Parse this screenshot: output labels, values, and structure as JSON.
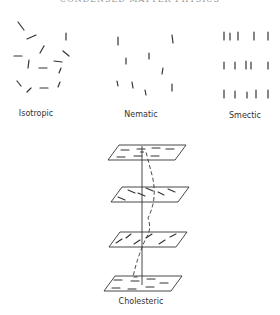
{
  "header": {
    "title": "CONDENSED MATTER PHYSICS"
  },
  "labels": {
    "isotropic": "Isotropic",
    "nematic": "Nematic",
    "smectic": "Smectic",
    "cholesteric": "Cholesteric"
  },
  "colors": {
    "ink": "#333333",
    "background": "#ffffff"
  },
  "phases": {
    "isotropic": {
      "molecules": [
        [
          18,
          22,
          24,
          30
        ],
        [
          27,
          39,
          36,
          35
        ],
        [
          66,
          33,
          66,
          40
        ],
        [
          14,
          56,
          22,
          56
        ],
        [
          40,
          53,
          44,
          46
        ],
        [
          63,
          51,
          69,
          56
        ],
        [
          54,
          61,
          62,
          62
        ],
        [
          29,
          60,
          28,
          68
        ],
        [
          39,
          68,
          47,
          68
        ],
        [
          61,
          68,
          59,
          73
        ],
        [
          17,
          81,
          21,
          86
        ],
        [
          60,
          82,
          58,
          87
        ],
        [
          27,
          92,
          31,
          88
        ],
        [
          40,
          88,
          48,
          88
        ]
      ]
    },
    "nematic": {
      "molecules": [
        [
          118,
          37,
          118,
          45
        ],
        [
          172,
          35,
          173,
          43
        ],
        [
          126,
          58,
          126,
          64
        ],
        [
          149,
          53,
          149,
          59
        ],
        [
          163,
          68,
          162,
          74
        ],
        [
          117,
          81,
          118,
          86
        ],
        [
          132,
          82,
          133,
          88
        ],
        [
          145,
          90,
          146,
          95
        ],
        [
          172,
          84,
          172,
          91
        ]
      ]
    },
    "smectic": {
      "rows": [
        [
          [
            224,
            32,
            224,
            40
          ],
          [
            230,
            33,
            230,
            40
          ],
          [
            238,
            32,
            238,
            40
          ],
          [
            254,
            32,
            254,
            40
          ],
          [
            268,
            32,
            268,
            40
          ]
        ],
        [
          [
            224,
            62,
            224,
            69
          ],
          [
            235,
            62,
            235,
            69
          ],
          [
            246,
            61,
            246,
            69
          ],
          [
            251,
            62,
            251,
            69
          ],
          [
            268,
            62,
            268,
            69
          ]
        ],
        [
          [
            224,
            90,
            224,
            98
          ],
          [
            235,
            91,
            235,
            98
          ],
          [
            247,
            92,
            247,
            98
          ],
          [
            256,
            90,
            256,
            98
          ],
          [
            268,
            90,
            268,
            98
          ]
        ]
      ]
    },
    "cholesteric": {
      "planes": [
        {
          "points": "119,145 186,145 175,160 108,160",
          "dashes": [
            [
              121,
              150,
              129,
              150
            ],
            [
              137,
              149,
              145,
              149
            ],
            [
              152,
              148,
              160,
              148
            ],
            [
              166,
              149,
              174,
              149
            ],
            [
              117,
              157,
              125,
              157
            ],
            [
              134,
              156,
              142,
              156
            ],
            [
              151,
              156,
              159,
              156
            ]
          ]
        },
        {
          "points": "122,187 189,187 178,202 111,202",
          "dashes": [
            [
              118,
              197,
              125,
              200
            ],
            [
              128,
              190,
              135,
              193
            ],
            [
              138,
              193,
              145,
              196
            ],
            [
              146,
              188,
              153,
              191
            ],
            [
              158,
              192,
              164,
              195
            ],
            [
              168,
              189,
              175,
              192
            ]
          ]
        },
        {
          "points": "120,232 187,232 176,247 109,247",
          "dashes": [
            [
              116,
              243,
              122,
              239
            ],
            [
              126,
              238,
              131,
              234
            ],
            [
              134,
              244,
              140,
              240
            ],
            [
              146,
              238,
              152,
              234
            ],
            [
              159,
              244,
              165,
              240
            ],
            [
              170,
              237,
              176,
              234
            ]
          ]
        },
        {
          "points": "115,276 182,276 171,291 104,291",
          "dashes": [
            [
              114,
              280,
              122,
              280
            ],
            [
              131,
              281,
              139,
              281
            ],
            [
              147,
              279,
              155,
              279
            ],
            [
              160,
              283,
              168,
              283
            ],
            [
              112,
              288,
              120,
              288
            ],
            [
              128,
              289,
              136,
              289
            ],
            [
              146,
              287,
              154,
              287
            ]
          ]
        }
      ],
      "axis": [
        142,
        146,
        142,
        285
      ],
      "helix_path": "M 140,152 L 146,152 L 152,175 Q 158,198 148,218 Q 152,230 146,238 Q 137,258 133,277 L 140,277"
    }
  }
}
